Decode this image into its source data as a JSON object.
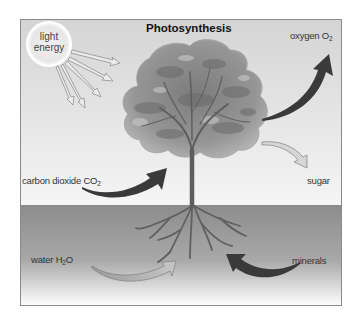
{
  "diagram": {
    "title": "Photosynthesis",
    "colors": {
      "sky_top": "#d6d6d6",
      "sky_bottom": "#f4f4f4",
      "ground_top": "#8e8e8e",
      "ground_bottom": "#ffffff",
      "frame": "#888888",
      "dark_arrow": "#3a3a3a",
      "light_arrow": "#bdbdbd",
      "canopy": "#8a8a8a",
      "trunk": "#6d6d6d"
    },
    "sun": {
      "label_line1": "light",
      "label_line2": "energy",
      "ray_count": 5
    },
    "labels": {
      "oxygen": {
        "text": "oxygen O",
        "sub": "2"
      },
      "carbon_dioxide": {
        "text": "carbon dioxide CO",
        "sub": "2"
      },
      "sugar": {
        "text": "sugar"
      },
      "water": {
        "text": "water H",
        "sub": "2",
        "suffix": "O"
      },
      "minerals": {
        "text": "minerals"
      }
    },
    "flows": [
      {
        "name": "light energy",
        "direction": "in",
        "target": "leaves"
      },
      {
        "name": "carbon dioxide CO2",
        "direction": "in",
        "target": "leaves"
      },
      {
        "name": "water H2O",
        "direction": "in",
        "target": "roots"
      },
      {
        "name": "minerals",
        "direction": "in",
        "target": "roots"
      },
      {
        "name": "oxygen O2",
        "direction": "out",
        "source": "leaves"
      },
      {
        "name": "sugar",
        "direction": "out",
        "source": "leaves"
      }
    ]
  }
}
